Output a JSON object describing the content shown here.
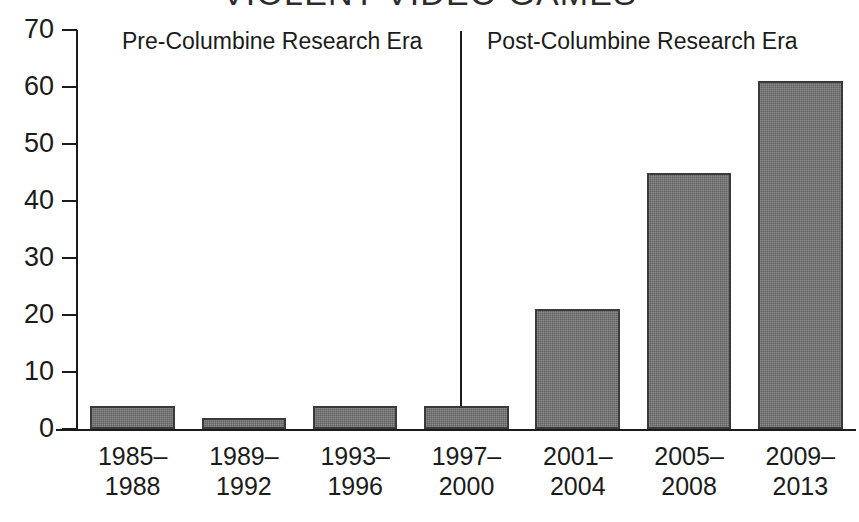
{
  "chart_data": {
    "type": "bar",
    "title": "VIOLENT VIDEO GAMES",
    "xlabel": "",
    "ylabel": "",
    "categories": [
      "1985–1988",
      "1989–1992",
      "1993–1996",
      "1997–2000",
      "2001–2004",
      "2005–2008",
      "2009–2013"
    ],
    "category_lines": [
      [
        "1985–",
        "1988"
      ],
      [
        "1989–",
        "1992"
      ],
      [
        "1993–",
        "1996"
      ],
      [
        "1997–",
        "2000"
      ],
      [
        "2001–",
        "2004"
      ],
      [
        "2005–",
        "2008"
      ],
      [
        "2009–",
        "2013"
      ]
    ],
    "values": [
      4,
      2,
      4,
      4,
      21,
      45,
      61
    ],
    "ylim": [
      0,
      70
    ],
    "yticks": [
      0,
      10,
      20,
      30,
      40,
      50,
      60,
      70
    ],
    "ytick_labels": [
      "0",
      "10",
      "20",
      "30",
      "40",
      "50",
      "60",
      "70"
    ],
    "grid": false,
    "legend": "none",
    "bar_color": "#6d6d6d",
    "bar_edge_color": "#3a3a3a",
    "axis_color": "#1b1b1b",
    "background_color": "#ffffff",
    "annotations": [
      {
        "name": "pre-columbine-era-label",
        "text": "Pre-Columbine Research Era"
      },
      {
        "name": "post-columbine-era-label",
        "text": "Post-Columbine Research Era"
      },
      {
        "name": "era-divider-line",
        "text": "",
        "between_categories": [
          "1997–2000",
          "2001–2004"
        ]
      }
    ]
  }
}
